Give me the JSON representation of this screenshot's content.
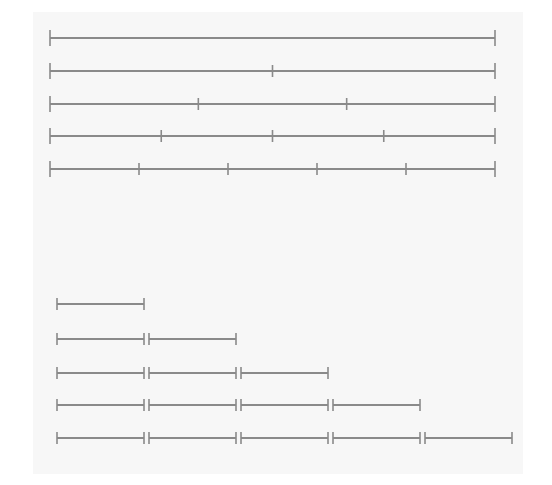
{
  "diagram": {
    "stroke_color": "#8a8a8a",
    "background": "#f7f7f7",
    "top_group": {
      "description": "Whole line divided into equal parts",
      "x_start": 50,
      "x_end": 495,
      "rows": [
        {
          "y": 38,
          "parts": 1
        },
        {
          "y": 71,
          "parts": 2
        },
        {
          "y": 104,
          "parts": 3
        },
        {
          "y": 136,
          "parts": 4
        },
        {
          "y": 169,
          "parts": 5
        }
      ]
    },
    "bottom_group": {
      "description": "Repeated unit segments placed end to end",
      "x_start": 57,
      "segment_length": 87,
      "gap": 5,
      "rows": [
        {
          "y": 304,
          "segments": 1
        },
        {
          "y": 339,
          "segments": 2
        },
        {
          "y": 373,
          "segments": 3
        },
        {
          "y": 405,
          "segments": 4
        },
        {
          "y": 438,
          "segments": 5
        }
      ]
    }
  }
}
